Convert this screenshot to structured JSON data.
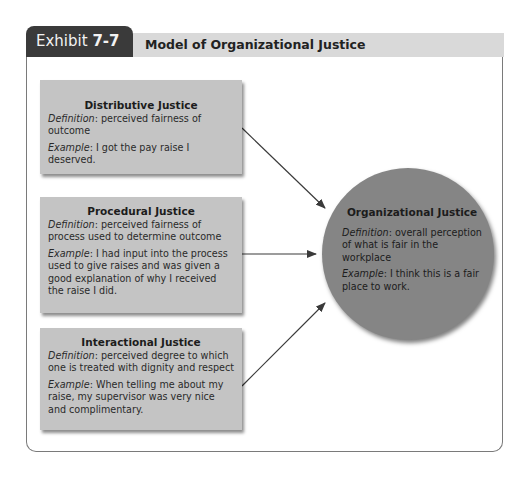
{
  "exhibit": {
    "label": "Exhibit",
    "number": "7-7",
    "title": "Model of Organizational Justice"
  },
  "components": [
    {
      "title": "Distributive Justice",
      "definition_label": "Definition",
      "definition": ": perceived fairness of outcome",
      "example_label": "Example",
      "example": ": I got the pay raise I deserved."
    },
    {
      "title": "Procedural Justice",
      "definition_label": "Definition",
      "definition": ": perceived fairness of process used to determine outcome",
      "example_label": "Example",
      "example": ": I had input into the process used to give raises and was given a good explanation of why I received the raise I did."
    },
    {
      "title": "Interactional Justice",
      "definition_label": "Definition",
      "definition": ": perceived degree to which one is treated with dignity and respect",
      "example_label": "Example",
      "example": ": When telling me about my raise, my supervisor was very nice and complimentary."
    }
  ],
  "outcome": {
    "title": "Organizational Justice",
    "definition_label": "Definition",
    "definition": ": overall perception of what is fair in the workplace",
    "example_label": "Example",
    "example": ": I think this is a fair place to work."
  },
  "colors": {
    "tab": "#3a3a3a",
    "title_bar": "#d9d9d9",
    "box_fill": "#c4c4c4",
    "circle_fill": "#858585",
    "arrow": "#3a3a3a"
  }
}
